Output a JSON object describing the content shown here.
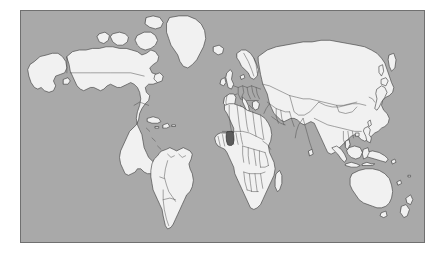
{
  "figure": {
    "kind": "world-locator-map",
    "projection": "equirectangular",
    "background_color": "#ffffff",
    "frame": {
      "border_color": "#707070",
      "x": 20,
      "y": 10,
      "width": 405,
      "height": 233
    }
  },
  "map": {
    "ocean_color": "#a9a9a9",
    "land_color": "#f1f1f1",
    "border_color": "#4a4a4a",
    "coast_color": "#3d3d3d",
    "highlight_color": "#5b5b5b",
    "lon_range": [
      -180,
      180
    ],
    "lat_range": [
      -58,
      84
    ],
    "graticule": "none",
    "labels": "none"
  },
  "highlight": {
    "name": "Ghana",
    "region": "West Africa",
    "color": "#5b5b5b",
    "approx_center_lon": 1.2,
    "approx_center_lat": 7.9
  },
  "landmasses": [
    {
      "name": "north-america"
    },
    {
      "name": "greenland"
    },
    {
      "name": "south-america"
    },
    {
      "name": "africa"
    },
    {
      "name": "europe"
    },
    {
      "name": "asia"
    },
    {
      "name": "australia"
    },
    {
      "name": "new-zealand"
    },
    {
      "name": "japan"
    },
    {
      "name": "indonesia"
    },
    {
      "name": "philippines"
    },
    {
      "name": "iceland"
    },
    {
      "name": "british-isles"
    },
    {
      "name": "madagascar"
    },
    {
      "name": "sri-lanka"
    },
    {
      "name": "caribbean"
    },
    {
      "name": "new-guinea"
    }
  ]
}
